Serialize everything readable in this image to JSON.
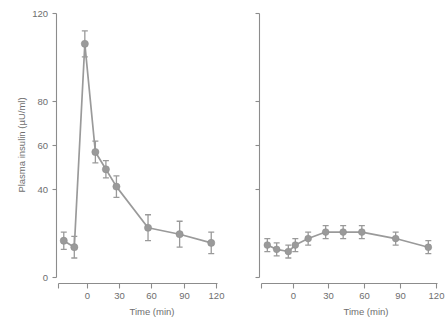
{
  "chart_data": [
    {
      "type": "line",
      "panel": "left",
      "title": "",
      "xlabel": "Time (min)",
      "ylabel": "Plasma insulin (µU/ml)",
      "xlim": [
        -25,
        125
      ],
      "ylim": [
        0,
        122
      ],
      "xticks": [
        0,
        30,
        60,
        90,
        120
      ],
      "xticklabels": [
        "0",
        "30",
        "60",
        "90",
        "120"
      ],
      "yticks": [
        0,
        40,
        60,
        80,
        120
      ],
      "yticklabels": [
        "0",
        "40",
        "60",
        "80",
        "120"
      ],
      "grid": false,
      "legend": "none",
      "series": [
        {
          "name": "plasma insulin",
          "x": [
            -20,
            -10,
            0,
            10,
            20,
            30,
            60,
            90,
            120
          ],
          "values": [
            17,
            14,
            108,
            58,
            50,
            42,
            23,
            20,
            16
          ],
          "errors": [
            4,
            5,
            6,
            5,
            4,
            5,
            6,
            6,
            5
          ],
          "marker": "circle",
          "color": "#9a9a9a"
        }
      ]
    },
    {
      "type": "line",
      "panel": "right",
      "title": "",
      "xlabel": "Time (min)",
      "ylabel": "",
      "xlim": [
        -25,
        125
      ],
      "ylim": [
        0,
        122
      ],
      "xticks": [
        0,
        30,
        60,
        90,
        120
      ],
      "xticklabels": [
        "0",
        "30",
        "60",
        "90",
        "120"
      ],
      "yticks": [
        0,
        40,
        60,
        80,
        120
      ],
      "yticklabels": [
        "",
        "",
        "",
        "",
        ""
      ],
      "grid": false,
      "legend": "none",
      "series": [
        {
          "name": "plasma insulin",
          "x": [
            -20,
            -12,
            -2,
            4,
            15,
            30,
            45,
            61,
            90,
            118
          ],
          "values": [
            15,
            13,
            12,
            15,
            18,
            21,
            21,
            21,
            18,
            14
          ],
          "errors": [
            3,
            3,
            3,
            3,
            3,
            3,
            3,
            3,
            3,
            3
          ],
          "marker": "circle",
          "color": "#9a9a9a"
        }
      ]
    }
  ],
  "axes": {
    "y_title_left": "Plasma insulin (µU/ml)",
    "x_title_left": "Time (min)",
    "x_title_right": "Time (min)",
    "y_labels": [
      "120",
      "80",
      "60",
      "40",
      "0"
    ],
    "x_labels": [
      "0",
      "30",
      "60",
      "90",
      "120"
    ]
  },
  "colors": {
    "line": "#9a9a9a",
    "marker": "#9a9a9a",
    "axis": "#8c8c8c",
    "text": "#6e6e6e",
    "background": "#ffffff"
  }
}
